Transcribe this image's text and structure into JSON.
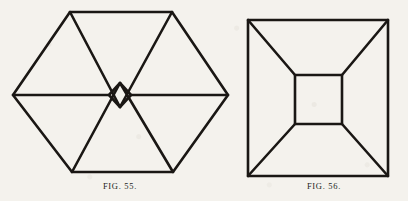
{
  "page": {
    "background_color": "#f4f2ed",
    "ink_color": "#1a1714",
    "width": 408,
    "height": 201
  },
  "figures": [
    {
      "id": "figure-55",
      "caption": "FIG. 55.",
      "shape_name": "hexagon-with-central-rhombus",
      "stroke_color": "#1a1714",
      "stroke_width": 2.6,
      "outline_label": "hexagon-outline",
      "inner_label": "central-diamond",
      "vertices": {
        "left": [
          13,
          95
        ],
        "top_left": [
          70,
          12
        ],
        "top_right": [
          172,
          12
        ],
        "right": [
          228,
          95
        ],
        "bottom_right": [
          173,
          172
        ],
        "bottom_left": [
          72,
          172
        ]
      },
      "diamond": {
        "top": [
          120,
          83
        ],
        "right": [
          131,
          95
        ],
        "bottom": [
          120,
          107
        ],
        "left": [
          109,
          95
        ]
      },
      "internal_lines": [
        "left-vertex-to-diamond-left",
        "diamond-right-to-right-vertex",
        "top-left-corner-to-diamond-bottom",
        "top-right-corner-to-diamond-bottom",
        "bottom-left-corner-to-diamond-top",
        "bottom-right-corner-to-diamond-top"
      ]
    },
    {
      "id": "figure-56",
      "caption": "FIG. 56.",
      "shape_name": "square-with-inner-square-and-corner-diagonals",
      "stroke_color": "#1a1714",
      "stroke_width": 2.6,
      "outline_label": "outer-square",
      "inner_label": "inner-square",
      "outer_square": {
        "top_left": [
          8,
          20
        ],
        "top_right": [
          148,
          20
        ],
        "bottom_right": [
          148,
          176
        ],
        "bottom_left": [
          8,
          176
        ]
      },
      "inner_square": {
        "top_left": [
          55,
          75
        ],
        "top_right": [
          102,
          75
        ],
        "bottom_right": [
          102,
          124
        ],
        "bottom_left": [
          55,
          124
        ]
      },
      "internal_lines": [
        "outer-top-left-to-inner-top-left",
        "outer-top-right-to-inner-top-right",
        "outer-bottom-right-to-inner-bottom-right",
        "outer-bottom-left-to-inner-bottom-left"
      ]
    }
  ]
}
